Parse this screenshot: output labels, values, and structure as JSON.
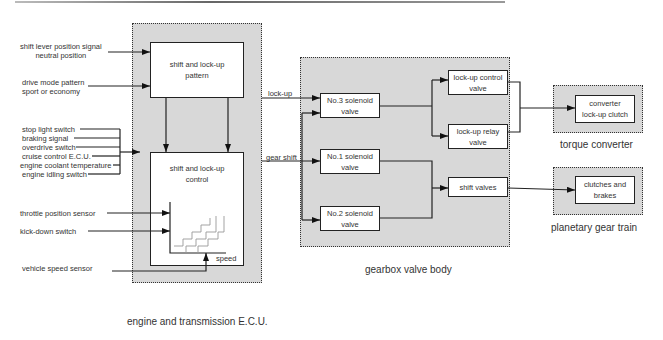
{
  "ecu": {
    "caption": "engine and transmission E.C.U.",
    "pattern_box": "shift and lock-up\npattern",
    "control_box": "shift and lock-up\ncontrol",
    "speed_label": "speed"
  },
  "inputs": {
    "shift_lever": "shift lever position signal\nneutral position",
    "drive_mode": "drive mode pattern\nsport or economy",
    "grouped": [
      "stop light switch",
      "braking signal",
      "overdrive switch",
      "cruise control E.C.U.",
      "engine coolant temperature",
      "engine idling switch"
    ],
    "throttle": "throttle position sensor",
    "kickdown": "kick-down switch",
    "vehicle_speed": "vehicle speed sensor"
  },
  "signals": {
    "lockup": "lock-up",
    "gear_shift": "gear shift"
  },
  "gearbox": {
    "caption": "gearbox valve body",
    "sol3": "No.3 solenoid\nvalve",
    "sol1": "No.1 solenoid\nvalve",
    "sol2": "No.2 solenoid\nvalve",
    "lockup_control": "lock-up control\nvalve",
    "lockup_relay": "lock-up relay\nvalve",
    "shift_valves": "shift valves"
  },
  "torque_converter": {
    "caption": "torque converter",
    "box": "converter\nlock-up clutch"
  },
  "planetary": {
    "caption": "planetary gear train",
    "box": "clutches and\nbrakes"
  }
}
